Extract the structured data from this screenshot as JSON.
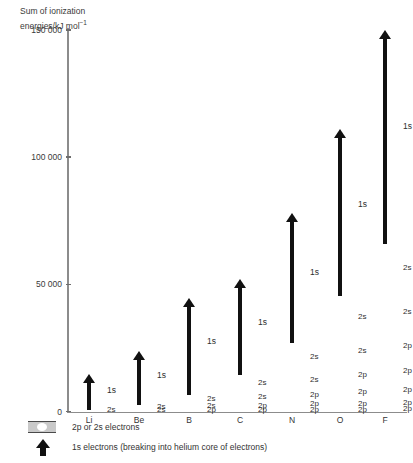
{
  "chart_data": {
    "type": "bar",
    "title": "",
    "ylabel": "Sum of ionization energies/kJ mol⁻¹",
    "xlabel": "",
    "ylim": [
      0,
      150000
    ],
    "yticks": [
      0,
      50000,
      100000,
      150000
    ],
    "ytick_labels": [
      "0",
      "50 000",
      "100 000",
      "150 000"
    ],
    "grid": false,
    "legend_position": "below-axes",
    "categories": [
      "Li",
      "Be",
      "B",
      "C",
      "N",
      "O",
      "F"
    ],
    "series": [
      {
        "name": "2p or 2s electrons (cumulative shell sum)",
        "values": [
          520,
          2660,
          6690,
          14480,
          26980,
          45300,
          66000
        ]
      },
      {
        "name": "1s electrons (breaking into helium core of electrons)",
        "values": [
          14900,
          23800,
          44700,
          52000,
          78000,
          111000,
          150000
        ]
      }
    ],
    "elements": [
      {
        "symbol": "Li",
        "x_center": 89,
        "shell_top": 520,
        "arrow_top": 14900,
        "one_s_label": "1s",
        "segments": [
          {
            "label": "2s",
            "from": 0,
            "to": 520
          }
        ]
      },
      {
        "symbol": "Be",
        "x_center": 139,
        "shell_top": 2660,
        "arrow_top": 23800,
        "one_s_label": "1s",
        "segments": [
          {
            "label": "2s",
            "from": 0,
            "to": 900
          },
          {
            "label": "2s",
            "from": 900,
            "to": 2660
          }
        ]
      },
      {
        "symbol": "B",
        "x_center": 189,
        "shell_top": 6690,
        "arrow_top": 44700,
        "one_s_label": "1s",
        "segments": [
          {
            "label": "2p",
            "from": 0,
            "to": 800
          },
          {
            "label": "2s",
            "from": 800,
            "to": 3460
          },
          {
            "label": "2s",
            "from": 3460,
            "to": 6690
          }
        ]
      },
      {
        "symbol": "C",
        "x_center": 240,
        "shell_top": 14480,
        "arrow_top": 52000,
        "one_s_label": "1s",
        "segments": [
          {
            "label": "2p",
            "from": 0,
            "to": 1090
          },
          {
            "label": "2p",
            "from": 1090,
            "to": 3440
          },
          {
            "label": "2s",
            "from": 3440,
            "to": 8080
          },
          {
            "label": "2s",
            "from": 8080,
            "to": 14480
          }
        ]
      },
      {
        "symbol": "N",
        "x_center": 292,
        "shell_top": 26980,
        "arrow_top": 78000,
        "one_s_label": "1s",
        "segments": [
          {
            "label": "2p",
            "from": 0,
            "to": 1400
          },
          {
            "label": "2p",
            "from": 1400,
            "to": 4270
          },
          {
            "label": "2p",
            "from": 4270,
            "to": 8850
          },
          {
            "label": "2s",
            "from": 8850,
            "to": 16200
          },
          {
            "label": "2s",
            "from": 16200,
            "to": 26980
          }
        ]
      },
      {
        "symbol": "O",
        "x_center": 340,
        "shell_top": 45300,
        "arrow_top": 111000,
        "one_s_label": "1s",
        "segments": [
          {
            "label": "2p",
            "from": 0,
            "to": 1310
          },
          {
            "label": "2p",
            "from": 1310,
            "to": 4810
          },
          {
            "label": "2p",
            "from": 4810,
            "to": 10370
          },
          {
            "label": "2p",
            "from": 10370,
            "to": 18000
          },
          {
            "label": "2s",
            "from": 18000,
            "to": 29300
          },
          {
            "label": "2s",
            "from": 29300,
            "to": 45300
          }
        ]
      },
      {
        "symbol": "F",
        "x_center": 385,
        "shell_top": 66000,
        "arrow_top": 150000,
        "one_s_label": "1s",
        "segments": [
          {
            "label": "2p",
            "from": 0,
            "to": 1680
          },
          {
            "label": "2p",
            "from": 1680,
            "to": 5180
          },
          {
            "label": "2p",
            "from": 5180,
            "to": 11560
          },
          {
            "label": "2p",
            "from": 11560,
            "to": 20400
          },
          {
            "label": "2p",
            "from": 20400,
            "to": 31000
          },
          {
            "label": "2s",
            "from": 31000,
            "to": 47000
          },
          {
            "label": "2s",
            "from": 47000,
            "to": 66000
          }
        ]
      }
    ]
  },
  "axis": {
    "title_line1": "Sum of ionization",
    "title_line2": "energies/kJ mol",
    "title_exponent": "−1"
  },
  "legend": {
    "items": [
      {
        "icon": "shell-swatch-icon",
        "text_pre": "2",
        "text_sub": "p",
        "text_post": " or 2s electrons",
        "full": "2p or 2s electrons"
      },
      {
        "icon": "black-up-arrow-icon",
        "full": "1s electrons (breaking into helium core of electrons)"
      }
    ]
  }
}
